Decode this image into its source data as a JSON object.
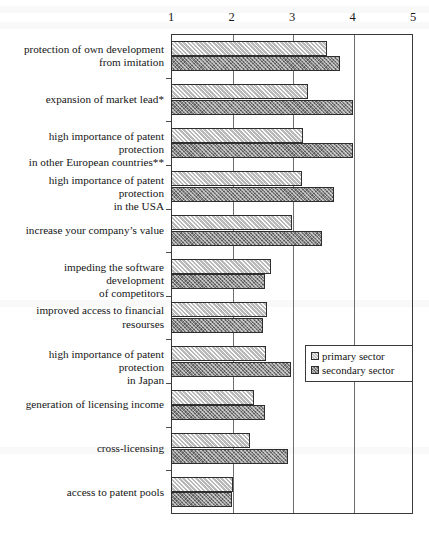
{
  "chart_data": {
    "type": "bar",
    "orientation": "horizontal",
    "title": "",
    "xlabel": "",
    "ylabel": "",
    "xlim": [
      1,
      5
    ],
    "xticks": [
      "1",
      "2",
      "3",
      "4",
      "5"
    ],
    "grid": true,
    "legend_position": "middle-right",
    "categories": [
      "protection of own development from imitation",
      "expansion of market lead*",
      "high importance of patent protection in other European countries**",
      "high importance of patent protection in the USA",
      "increase your company’s value",
      "impeding the software development of competitors",
      "improved access to financial resourses",
      "high importance of patent protection in Japan",
      "generation of licensing income",
      "cross-licensing",
      "access to patent pools"
    ],
    "category_lines": [
      [
        "protection of own development",
        "from imitation"
      ],
      [
        "expansion of market lead*"
      ],
      [
        "high importance of patent protection",
        "in other European countries**"
      ],
      [
        "high importance of patent protection",
        "in the USA"
      ],
      [
        "increase your company’s value"
      ],
      [
        "impeding the software development",
        "of competitors"
      ],
      [
        "improved access to financial",
        "resourses"
      ],
      [
        "high importance of patent protection",
        "in Japan"
      ],
      [
        "generation of licensing income"
      ],
      [
        "cross-licensing"
      ],
      [
        "access to patent pools"
      ]
    ],
    "series": [
      {
        "name": "primary sector",
        "values": [
          3.58,
          3.27,
          3.19,
          3.17,
          3.0,
          2.66,
          2.59,
          2.57,
          2.38,
          2.31,
          2.03
        ]
      },
      {
        "name": "secondary sector",
        "values": [
          3.8,
          4.01,
          4.0,
          3.7,
          3.5,
          2.56,
          2.52,
          2.99,
          2.56,
          2.93,
          2.0
        ]
      }
    ]
  },
  "legend": {
    "items": [
      {
        "label": "primary sector",
        "swatch": "primary"
      },
      {
        "label": "secondary sector",
        "swatch": "secondary"
      }
    ]
  },
  "colors": {
    "primary_bar": "#b9b9b9",
    "secondary_bar": "#8a8a8a",
    "axis": "#3a3a3a",
    "gridline": "#6e6e6e",
    "text": "#151515",
    "background": "#ffffff"
  }
}
